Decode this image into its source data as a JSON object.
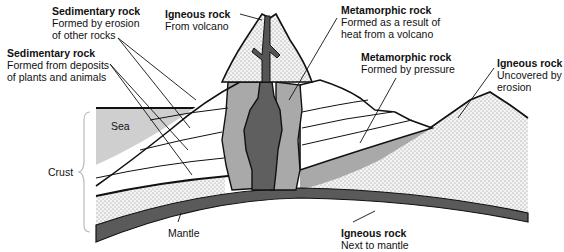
{
  "diagram": {
    "labels": {
      "sed_erosion": {
        "title": "Sedimentary rock",
        "desc1": "Formed by erosion",
        "desc2": "of other rocks"
      },
      "sed_deposits": {
        "title": "Sedimentary rock",
        "desc1": "Formed from deposits",
        "desc2": "of plants and animals"
      },
      "ign_volcano": {
        "title": "Igneous rock",
        "desc1": "From volcano"
      },
      "meta_heat": {
        "title": "Metamorphic rock",
        "desc1": "Formed as a result of",
        "desc2": "heat from a volcano"
      },
      "meta_pressure": {
        "title": "Metamorphic rock",
        "desc1": "Formed by pressure"
      },
      "ign_uncovered": {
        "title": "Igneous rock",
        "desc1": "Uncovered by",
        "desc2": "erosion"
      },
      "ign_mantle": {
        "title": "Igneous rock",
        "desc1": "Next to mantle"
      }
    },
    "regions": {
      "sea": "Sea",
      "crust": "Crust",
      "mantle": "Mantle"
    },
    "colors": {
      "mantle": "#5a5a5a",
      "magma": "#5f5f5f",
      "metamorphic": "#a9a9a9",
      "sea": "#cfcfcf",
      "igneous_stipple": "#f2f2f2",
      "outline": "#111111"
    }
  }
}
